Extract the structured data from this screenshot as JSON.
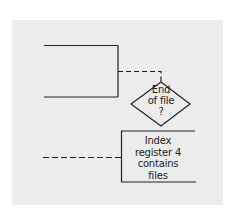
{
  "diagram": {
    "type": "flowchart-fragment",
    "background_color": "#ececec",
    "stroke_color": "#222222",
    "nodes": [
      {
        "id": "open-bracket",
        "shape": "bracket",
        "lines": []
      },
      {
        "id": "decision",
        "shape": "diamond",
        "lines": [
          "End",
          "of file",
          "?"
        ]
      },
      {
        "id": "process",
        "shape": "annotation-bracket",
        "lines": [
          "Index",
          "register 4",
          "contains",
          "files"
        ]
      }
    ],
    "connectors": [
      {
        "from": "open-bracket",
        "to": "decision",
        "style": "dashed"
      },
      {
        "from": "left-edge",
        "to": "process",
        "style": "dashed"
      }
    ]
  }
}
